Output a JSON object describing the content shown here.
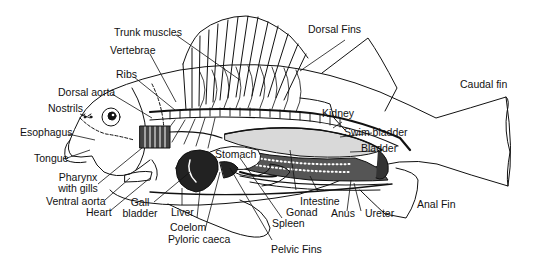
{
  "diagram": {
    "labels": {
      "trunk_muscles": "Trunk muscles",
      "dorsal_fins": "Dorsal Fins",
      "vertebrae": "Vertebrae",
      "ribs": "Ribs",
      "dorsal_aorta": "Dorsal aorta",
      "nostrils": "Nostrils",
      "caudal_fin": "Caudal fin",
      "esophagus": "Esophagus",
      "kidney": "Kidney",
      "swim_bladder": "Swim bladder",
      "bladder": "Bladder",
      "tongue": "Tongue",
      "stomach": "Stomach",
      "pharynx_line1": "Pharynx",
      "pharynx_line2": "with gills",
      "ventral_aorta": "Ventral aorta",
      "heart": "Heart",
      "gall_line1": "Gall",
      "gall_line2": "bladder",
      "liver": "Liver",
      "coelom": "Coelom",
      "pyloric_caeca": "Pyloric caeca",
      "intestine": "Intestine",
      "gonad": "Gonad",
      "anus": "Anus",
      "ureter": "Ureter",
      "anal_fin": "Anal Fin",
      "spleen": "Spleen",
      "pelvic_fins": "Pelvic Fins"
    },
    "colors": {
      "ink": "#111111",
      "background": "#ffffff",
      "swim_bladder_fill": "#d9d9d9"
    }
  }
}
